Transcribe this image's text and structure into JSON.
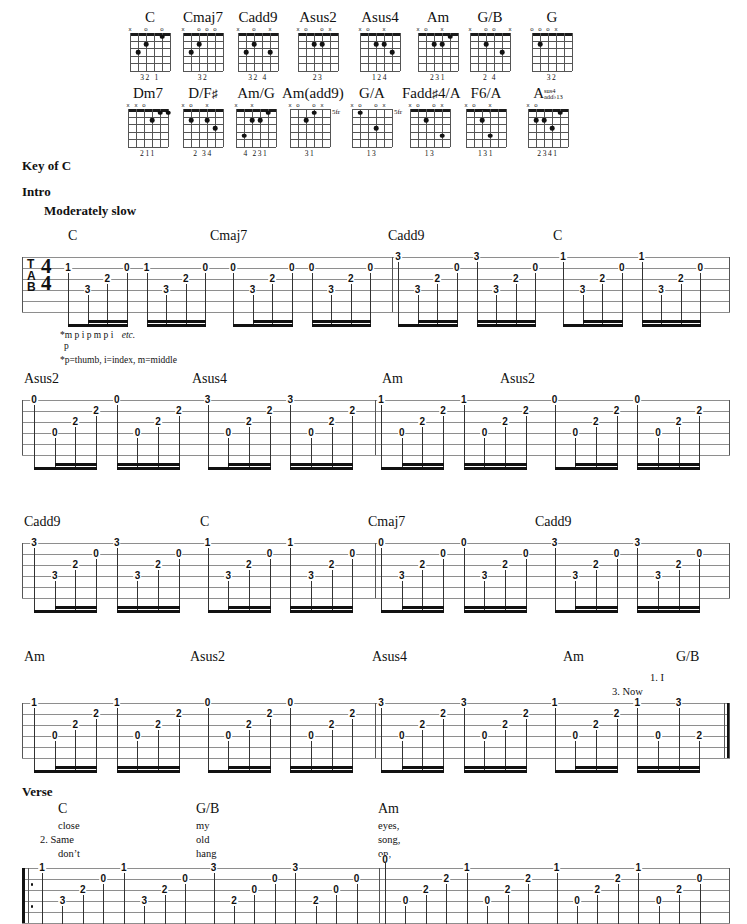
{
  "page": {
    "key_label": "Key of C",
    "intro_label": "Intro",
    "tempo_label": "Moderately slow",
    "verse_label": "Verse"
  },
  "chord_diagrams": {
    "row1": [
      {
        "name": "C",
        "markers": "x o o",
        "fingers": "32 1",
        "frets": null
      },
      {
        "name": "Cmaj7",
        "markers": "x ooo",
        "fingers": "32",
        "frets": null
      },
      {
        "name": "Cadd9",
        "markers": "x o x",
        "fingers": "32 4",
        "frets": null
      },
      {
        "name": "Asus2",
        "markers": "xo ox",
        "fingers": "23",
        "frets": null
      },
      {
        "name": "Asus4",
        "markers": "xo x",
        "fingers": "124",
        "frets": null
      },
      {
        "name": "Am",
        "markers": "xo x",
        "fingers": "231",
        "frets": null
      },
      {
        "name": "G/B",
        "markers": "x oo x",
        "fingers": "2 4",
        "frets": null
      },
      {
        "name": "G",
        "markers": "ooox",
        "fingers": "32",
        "frets": null
      }
    ],
    "row2": [
      {
        "name": "Dm7",
        "markers": "xxo",
        "fingers": "211",
        "frets": null
      },
      {
        "name": "D/F#",
        "markers": "xo x",
        "fingers": "2 34",
        "frets": null
      },
      {
        "name": "Am/G",
        "markers": "x x",
        "fingers": "4 231",
        "frets": null
      },
      {
        "name": "Am(add9)",
        "markers": "xo ox",
        "fingers": "31",
        "frets": "5fr"
      },
      {
        "name": "G/A",
        "markers": "xo ox",
        "fingers": "13",
        "frets": "5fr"
      },
      {
        "name": "Fadd#4/A",
        "markers": "xo ox",
        "fingers": "13",
        "frets": null
      },
      {
        "name": "F6/A",
        "markers": "xo x",
        "fingers": "131",
        "frets": null
      },
      {
        "name": "Asus4/add b13",
        "name_base": "A",
        "sup_top": "sus4",
        "sup_bot": "add♭13",
        "markers": "xo",
        "fingers": "2341",
        "frets": null
      }
    ]
  },
  "footnotes": {
    "fingering_line": "*m    p    i    p    m    p    i",
    "fingering_etc": "etc.",
    "fingering_p": "p",
    "legend": "*p=thumb, i=index, m=middle"
  },
  "systems": [
    {
      "id": "system-1",
      "chords": [
        {
          "label": "C",
          "x": 68
        },
        {
          "label": "Cmaj7",
          "x": 210
        },
        {
          "label": "Cadd9",
          "x": 388
        },
        {
          "label": "C",
          "x": 553
        }
      ],
      "measures": [
        {
          "notes": [
            {
              "s": 1,
              "f": "1"
            },
            {
              "s": 3,
              "f": "3"
            },
            {
              "s": 2,
              "f": "2"
            },
            {
              "s": 1,
              "f": "0"
            },
            {
              "s": 1,
              "f": "1"
            },
            {
              "s": 3,
              "f": "3"
            },
            {
              "s": 2,
              "f": "2"
            },
            {
              "s": 1,
              "f": "0"
            }
          ]
        },
        {
          "notes": [
            {
              "s": 1,
              "f": "0"
            },
            {
              "s": 3,
              "f": "3"
            },
            {
              "s": 2,
              "f": "2"
            },
            {
              "s": 1,
              "f": "0"
            },
            {
              "s": 1,
              "f": "0"
            },
            {
              "s": 3,
              "f": "3"
            },
            {
              "s": 2,
              "f": "2"
            },
            {
              "s": 1,
              "f": "0"
            }
          ]
        },
        {
          "notes": [
            {
              "s": 0,
              "f": "3"
            },
            {
              "s": 3,
              "f": "3"
            },
            {
              "s": 2,
              "f": "2"
            },
            {
              "s": 1,
              "f": "0"
            },
            {
              "s": 0,
              "f": "3"
            },
            {
              "s": 3,
              "f": "3"
            },
            {
              "s": 2,
              "f": "2"
            },
            {
              "s": 1,
              "f": "0"
            }
          ]
        },
        {
          "notes": [
            {
              "s": 0,
              "f": "1"
            },
            {
              "s": 3,
              "f": "3"
            },
            {
              "s": 2,
              "f": "2"
            },
            {
              "s": 1,
              "f": "0"
            },
            {
              "s": 0,
              "f": "1"
            },
            {
              "s": 3,
              "f": "3"
            },
            {
              "s": 2,
              "f": "2"
            },
            {
              "s": 1,
              "f": "0"
            }
          ]
        }
      ]
    },
    {
      "id": "system-2",
      "chords": [
        {
          "label": "Asus2",
          "x": 24
        },
        {
          "label": "Asus4",
          "x": 192
        },
        {
          "label": "Am",
          "x": 382
        },
        {
          "label": "Asus2",
          "x": 500
        }
      ],
      "measures": [
        {
          "notes": [
            {
              "s": 0,
              "f": "0"
            },
            {
              "s": 3,
              "f": "0"
            },
            {
              "s": 2,
              "f": "2"
            },
            {
              "s": 1,
              "f": "2"
            },
            {
              "s": 0,
              "f": "0"
            },
            {
              "s": 3,
              "f": "0"
            },
            {
              "s": 2,
              "f": "2"
            },
            {
              "s": 1,
              "f": "2"
            }
          ]
        },
        {
          "notes": [
            {
              "s": 0,
              "f": "3"
            },
            {
              "s": 3,
              "f": "0"
            },
            {
              "s": 2,
              "f": "2"
            },
            {
              "s": 1,
              "f": "2"
            },
            {
              "s": 0,
              "f": "3"
            },
            {
              "s": 3,
              "f": "0"
            },
            {
              "s": 2,
              "f": "2"
            },
            {
              "s": 1,
              "f": "2"
            }
          ]
        },
        {
          "notes": [
            {
              "s": 0,
              "f": "1"
            },
            {
              "s": 3,
              "f": "0"
            },
            {
              "s": 2,
              "f": "2"
            },
            {
              "s": 1,
              "f": "2"
            },
            {
              "s": 0,
              "f": "1"
            },
            {
              "s": 3,
              "f": "0"
            },
            {
              "s": 2,
              "f": "2"
            },
            {
              "s": 1,
              "f": "2"
            }
          ]
        },
        {
          "notes": [
            {
              "s": 0,
              "f": "0"
            },
            {
              "s": 3,
              "f": "0"
            },
            {
              "s": 2,
              "f": "2"
            },
            {
              "s": 1,
              "f": "2"
            },
            {
              "s": 0,
              "f": "0"
            },
            {
              "s": 3,
              "f": "0"
            },
            {
              "s": 2,
              "f": "2"
            },
            {
              "s": 1,
              "f": "2"
            }
          ]
        }
      ]
    },
    {
      "id": "system-3",
      "chords": [
        {
          "label": "Cadd9",
          "x": 24
        },
        {
          "label": "C",
          "x": 200
        },
        {
          "label": "Cmaj7",
          "x": 368
        },
        {
          "label": "Cadd9",
          "x": 535
        }
      ],
      "measures": [
        {
          "notes": [
            {
              "s": 0,
              "f": "3"
            },
            {
              "s": 3,
              "f": "3"
            },
            {
              "s": 2,
              "f": "2"
            },
            {
              "s": 1,
              "f": "0"
            },
            {
              "s": 0,
              "f": "3"
            },
            {
              "s": 3,
              "f": "3"
            },
            {
              "s": 2,
              "f": "2"
            },
            {
              "s": 1,
              "f": "0"
            }
          ]
        },
        {
          "notes": [
            {
              "s": 0,
              "f": "1"
            },
            {
              "s": 3,
              "f": "3"
            },
            {
              "s": 2,
              "f": "2"
            },
            {
              "s": 1,
              "f": "0"
            },
            {
              "s": 0,
              "f": "1"
            },
            {
              "s": 3,
              "f": "3"
            },
            {
              "s": 2,
              "f": "2"
            },
            {
              "s": 1,
              "f": "0"
            }
          ]
        },
        {
          "notes": [
            {
              "s": 0,
              "f": "0"
            },
            {
              "s": 3,
              "f": "3"
            },
            {
              "s": 2,
              "f": "2"
            },
            {
              "s": 1,
              "f": "0"
            },
            {
              "s": 0,
              "f": "0"
            },
            {
              "s": 3,
              "f": "3"
            },
            {
              "s": 2,
              "f": "2"
            },
            {
              "s": 1,
              "f": "0"
            }
          ]
        },
        {
          "notes": [
            {
              "s": 0,
              "f": "3"
            },
            {
              "s": 3,
              "f": "3"
            },
            {
              "s": 2,
              "f": "2"
            },
            {
              "s": 1,
              "f": "0"
            },
            {
              "s": 0,
              "f": "3"
            },
            {
              "s": 3,
              "f": "3"
            },
            {
              "s": 2,
              "f": "2"
            },
            {
              "s": 1,
              "f": "0"
            }
          ]
        }
      ]
    },
    {
      "id": "system-4",
      "chords": [
        {
          "label": "Am",
          "x": 24
        },
        {
          "label": "Asus2",
          "x": 190
        },
        {
          "label": "Asus4",
          "x": 372
        },
        {
          "label": "Am",
          "x": 563
        },
        {
          "label": "G/B",
          "x": 676
        }
      ],
      "endings": [
        {
          "num": "1.",
          "word": "I",
          "x": 650,
          "y": 672
        },
        {
          "num": "3.",
          "word": "Now",
          "x": 612,
          "y": 686
        }
      ],
      "measures": [
        {
          "notes": [
            {
              "s": 0,
              "f": "1"
            },
            {
              "s": 3,
              "f": "0"
            },
            {
              "s": 2,
              "f": "2"
            },
            {
              "s": 1,
              "f": "2"
            },
            {
              "s": 0,
              "f": "1"
            },
            {
              "s": 3,
              "f": "0"
            },
            {
              "s": 2,
              "f": "2"
            },
            {
              "s": 1,
              "f": "2"
            }
          ]
        },
        {
          "notes": [
            {
              "s": 0,
              "f": "0"
            },
            {
              "s": 3,
              "f": "0"
            },
            {
              "s": 2,
              "f": "2"
            },
            {
              "s": 1,
              "f": "2"
            },
            {
              "s": 0,
              "f": "0"
            },
            {
              "s": 3,
              "f": "0"
            },
            {
              "s": 2,
              "f": "2"
            },
            {
              "s": 1,
              "f": "2"
            }
          ]
        },
        {
          "notes": [
            {
              "s": 0,
              "f": "3"
            },
            {
              "s": 3,
              "f": "0"
            },
            {
              "s": 2,
              "f": "2"
            },
            {
              "s": 1,
              "f": "2"
            },
            {
              "s": 0,
              "f": "3"
            },
            {
              "s": 3,
              "f": "0"
            },
            {
              "s": 2,
              "f": "2"
            },
            {
              "s": 1,
              "f": "2"
            }
          ]
        },
        {
          "notes": [
            {
              "s": 0,
              "f": "1"
            },
            {
              "s": 3,
              "f": "0"
            },
            {
              "s": 2,
              "f": "2"
            },
            {
              "s": 1,
              "f": "2"
            },
            {
              "s": 0,
              "f": "1"
            },
            {
              "s": 3,
              "f": "0"
            },
            {
              "s": 0,
              "f": "3"
            },
            {
              "s": 3,
              "f": "2"
            }
          ]
        }
      ]
    }
  ],
  "verse": {
    "chords": [
      {
        "label": "C",
        "x": 58
      },
      {
        "label": "G/B",
        "x": 196
      },
      {
        "label": "Am",
        "x": 378
      }
    ],
    "lyric_lines": [
      {
        "cells": [
          {
            "t": "close",
            "x": 58
          },
          {
            "t": "my",
            "x": 196
          },
          {
            "t": "eyes,",
            "x": 378
          }
        ]
      },
      {
        "cells": [
          {
            "t": "2. Same",
            "x": 40
          },
          {
            "t": "old",
            "x": 196
          },
          {
            "t": "song,",
            "x": 378
          }
        ]
      },
      {
        "cells": [
          {
            "t": "don’t",
            "x": 58
          },
          {
            "t": "hang",
            "x": 196
          },
          {
            "t": "on,",
            "x": 378
          }
        ]
      }
    ]
  },
  "bottom_staff": {
    "id": "system-5",
    "repeat_start": true,
    "measures": [
      {
        "notes": [
          {
            "s": 0,
            "f": "1"
          },
          {
            "s": 3,
            "f": "3"
          },
          {
            "s": 2,
            "f": "2"
          },
          {
            "s": 1,
            "f": "0"
          },
          {
            "s": 0,
            "f": "1"
          },
          {
            "s": 3,
            "f": "3"
          },
          {
            "s": 2,
            "f": "2"
          },
          {
            "s": 1,
            "f": "0"
          }
        ]
      },
      {
        "notes": [
          {
            "s": 0,
            "f": "3"
          },
          {
            "s": 3,
            "f": "2"
          },
          {
            "s": 2,
            "f": "0"
          },
          {
            "s": 1,
            "f": "0"
          },
          {
            "s": 0,
            "f": "3"
          },
          {
            "s": 3,
            "f": "2"
          },
          {
            "s": 2,
            "f": "0"
          },
          {
            "s": 1,
            "f": "0"
          }
        ]
      },
      {
        "notes": [
          {
            "s": -1,
            "f": "0"
          },
          {
            "s": 3,
            "f": "0"
          },
          {
            "s": 2,
            "f": "2"
          },
          {
            "s": 1,
            "f": "2"
          },
          {
            "s": 0,
            "f": "1"
          },
          {
            "s": 3,
            "f": "0"
          },
          {
            "s": 2,
            "f": "2"
          },
          {
            "s": 1,
            "f": "2"
          }
        ]
      },
      {
        "notes": [
          {
            "s": 0,
            "f": "1"
          },
          {
            "s": 3,
            "f": "0"
          },
          {
            "s": 2,
            "f": "2"
          },
          {
            "s": 1,
            "f": "2"
          },
          {
            "s": 0,
            "f": "1"
          },
          {
            "s": 3,
            "f": "0"
          },
          {
            "s": 2,
            "f": "2"
          },
          {
            "s": 1,
            "f": "0"
          }
        ]
      }
    ]
  }
}
